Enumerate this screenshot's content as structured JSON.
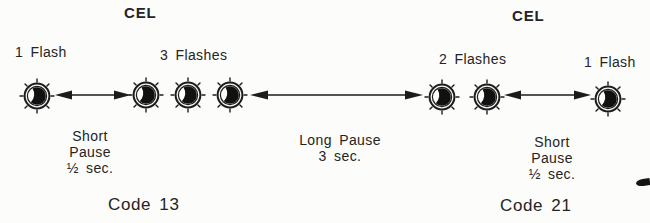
{
  "page": {
    "background": "#fcfcfa",
    "ink": "#242424",
    "lamp_ink": "#1c1c1c"
  },
  "left_section": {
    "cel_label": "CEL",
    "group_a": {
      "label": "1 Flash",
      "count": 1
    },
    "group_b": {
      "label": "3 Flashes",
      "count": 3
    },
    "pause": {
      "line1": "Short",
      "line2": "Pause",
      "line3": "½ sec."
    },
    "code_label": "Code 13"
  },
  "middle": {
    "pause": {
      "line1": "Long Pause",
      "line2": "3 sec."
    }
  },
  "right_section": {
    "cel_label": "CEL",
    "group_a": {
      "label": "2 Flashes",
      "count": 2
    },
    "group_b": {
      "label": "1 Flash",
      "count": 1
    },
    "pause": {
      "line1": "Short",
      "line2": "Pause",
      "line3": "½ sec."
    },
    "code_label": "Code 21"
  }
}
